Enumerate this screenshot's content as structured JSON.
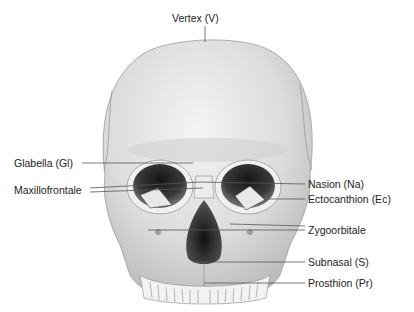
{
  "diagram": {
    "colors": {
      "bone": "#e6e6e4",
      "bone_shadow": "#bdbdbb",
      "cavity": "#2a2a2a",
      "leader": "#555555",
      "text": "#222222"
    },
    "labels": {
      "vertex": "Vertex (V)",
      "glabella": "Glabella (Gl)",
      "maxillofrontale": "Maxillofrontale",
      "nasion": "Nasion (Na)",
      "ectocanthion": "Ectocanthion (Ec)",
      "zygoorbitale": "Zygoorbitale",
      "subnasal": "Subnasal (S)",
      "prosthion": "Prosthion (Pr)"
    }
  }
}
